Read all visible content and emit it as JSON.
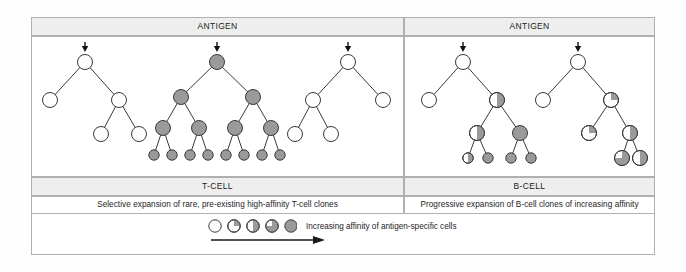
{
  "figure": {
    "panels": [
      {
        "id": "t-cell",
        "antigen_header": "ANTIGEN",
        "cell_type_label": "T-CELL",
        "description": "Selective expansion of rare, pre-existing high-affinity T-cell clones"
      },
      {
        "id": "b-cell",
        "antigen_header": "ANTIGEN",
        "cell_type_label": "B-CELL",
        "description": "Progressive expansion of B-cell clones of increasing affinity"
      }
    ],
    "legend": {
      "label": "Increasing affinity of antigen-specific cells",
      "swatches": [
        {
          "name": "affinity-0",
          "fill": 0
        },
        {
          "name": "affinity-25",
          "fill": 25
        },
        {
          "name": "affinity-50",
          "fill": 50
        },
        {
          "name": "affinity-75",
          "fill": 75
        },
        {
          "name": "affinity-100",
          "fill": 100
        }
      ],
      "arrow_direction": "right"
    },
    "colors": {
      "cell_gray": "#9a9a9a",
      "cell_white": "#ffffff",
      "stroke": "#3a3a3a",
      "band_gray": "#eeeeee",
      "frame": "#b0b0b0"
    },
    "trees": [
      {
        "name": "t-cell-clone-1",
        "antigen_arrow_x": 85,
        "nodes": [
          {
            "id": "t1n0",
            "x": 85,
            "y": 62,
            "fill": 0
          },
          {
            "id": "t1n1",
            "x": 50,
            "y": 100,
            "fill": 0
          },
          {
            "id": "t1n2",
            "x": 119,
            "y": 100,
            "fill": 0
          },
          {
            "id": "t1n3",
            "x": 101,
            "y": 134,
            "fill": 0
          },
          {
            "id": "t1n4",
            "x": 139,
            "y": 134,
            "fill": 0
          }
        ],
        "edges": [
          [
            "t1n0",
            "t1n1"
          ],
          [
            "t1n0",
            "t1n2"
          ],
          [
            "t1n2",
            "t1n3"
          ],
          [
            "t1n2",
            "t1n4"
          ]
        ]
      },
      {
        "name": "t-cell-clone-2",
        "antigen_arrow_x": 217,
        "nodes": [
          {
            "id": "t2n0",
            "x": 217,
            "y": 62,
            "fill": 100
          },
          {
            "id": "t2n1",
            "x": 181,
            "y": 97,
            "fill": 100
          },
          {
            "id": "t2n2",
            "x": 253,
            "y": 97,
            "fill": 100
          },
          {
            "id": "t2n3",
            "x": 163,
            "y": 128,
            "fill": 100
          },
          {
            "id": "t2n4",
            "x": 199,
            "y": 128,
            "fill": 100
          },
          {
            "id": "t2n5",
            "x": 235,
            "y": 128,
            "fill": 100
          },
          {
            "id": "t2n6",
            "x": 271,
            "y": 128,
            "fill": 100
          },
          {
            "id": "t2n7",
            "x": 154,
            "y": 155,
            "fill": 100
          },
          {
            "id": "t2n8",
            "x": 172,
            "y": 155,
            "fill": 100
          },
          {
            "id": "t2n9",
            "x": 190,
            "y": 155,
            "fill": 100
          },
          {
            "id": "t2n10",
            "x": 208,
            "y": 155,
            "fill": 100
          },
          {
            "id": "t2n11",
            "x": 226,
            "y": 155,
            "fill": 100
          },
          {
            "id": "t2n12",
            "x": 244,
            "y": 155,
            "fill": 100
          },
          {
            "id": "t2n13",
            "x": 262,
            "y": 155,
            "fill": 100
          },
          {
            "id": "t2n14",
            "x": 280,
            "y": 155,
            "fill": 100
          }
        ],
        "edges": [
          [
            "t2n0",
            "t2n1"
          ],
          [
            "t2n0",
            "t2n2"
          ],
          [
            "t2n1",
            "t2n3"
          ],
          [
            "t2n1",
            "t2n4"
          ],
          [
            "t2n2",
            "t2n5"
          ],
          [
            "t2n2",
            "t2n6"
          ],
          [
            "t2n3",
            "t2n7"
          ],
          [
            "t2n3",
            "t2n8"
          ],
          [
            "t2n4",
            "t2n9"
          ],
          [
            "t2n4",
            "t2n10"
          ],
          [
            "t2n5",
            "t2n11"
          ],
          [
            "t2n5",
            "t2n12"
          ],
          [
            "t2n6",
            "t2n13"
          ],
          [
            "t2n6",
            "t2n14"
          ]
        ]
      },
      {
        "name": "t-cell-clone-3",
        "antigen_arrow_x": 348,
        "nodes": [
          {
            "id": "t3n0",
            "x": 348,
            "y": 62,
            "fill": 0
          },
          {
            "id": "t3n1",
            "x": 313,
            "y": 100,
            "fill": 0
          },
          {
            "id": "t3n2",
            "x": 383,
            "y": 100,
            "fill": 0
          },
          {
            "id": "t3n3",
            "x": 295,
            "y": 134,
            "fill": 0
          },
          {
            "id": "t3n4",
            "x": 331,
            "y": 134,
            "fill": 0
          }
        ],
        "edges": [
          [
            "t3n0",
            "t3n1"
          ],
          [
            "t3n0",
            "t3n2"
          ],
          [
            "t3n1",
            "t3n3"
          ],
          [
            "t3n1",
            "t3n4"
          ]
        ]
      },
      {
        "name": "b-cell-clone-1",
        "antigen_arrow_x": 463,
        "nodes": [
          {
            "id": "b1n0",
            "x": 463,
            "y": 62,
            "fill": 0
          },
          {
            "id": "b1n1",
            "x": 429,
            "y": 100,
            "fill": 0
          },
          {
            "id": "b1n2",
            "x": 497,
            "y": 100,
            "fill": 50
          },
          {
            "id": "b1n3",
            "x": 477,
            "y": 133,
            "fill": 50
          },
          {
            "id": "b1n4",
            "x": 520,
            "y": 133,
            "fill": 100
          },
          {
            "id": "b1n5",
            "x": 468,
            "y": 158,
            "fill": 50
          },
          {
            "id": "b1n6",
            "x": 488,
            "y": 158,
            "fill": 100
          },
          {
            "id": "b1n7",
            "x": 511,
            "y": 158,
            "fill": 100
          },
          {
            "id": "b1n8",
            "x": 531,
            "y": 158,
            "fill": 100
          }
        ],
        "edges": [
          [
            "b1n0",
            "b1n1"
          ],
          [
            "b1n0",
            "b1n2"
          ],
          [
            "b1n2",
            "b1n3"
          ],
          [
            "b1n2",
            "b1n4"
          ],
          [
            "b1n3",
            "b1n5"
          ],
          [
            "b1n3",
            "b1n6"
          ],
          [
            "b1n4",
            "b1n7"
          ],
          [
            "b1n4",
            "b1n8"
          ]
        ]
      },
      {
        "name": "b-cell-clone-2",
        "antigen_arrow_x": 578,
        "nodes": [
          {
            "id": "b2n0",
            "x": 578,
            "y": 62,
            "fill": 0
          },
          {
            "id": "b2n1",
            "x": 543,
            "y": 100,
            "fill": 0
          },
          {
            "id": "b2n2",
            "x": 611,
            "y": 100,
            "fill": 25
          },
          {
            "id": "b2n3",
            "x": 589,
            "y": 133,
            "fill": 25
          },
          {
            "id": "b2n4",
            "x": 630,
            "y": 133,
            "fill": 50
          },
          {
            "id": "b2n5",
            "x": 622,
            "y": 158,
            "fill": 75
          },
          {
            "id": "b2n6",
            "x": 640,
            "y": 158,
            "fill": 50
          }
        ],
        "edges": [
          [
            "b2n0",
            "b2n1"
          ],
          [
            "b2n0",
            "b2n2"
          ],
          [
            "b2n2",
            "b2n3"
          ],
          [
            "b2n2",
            "b2n4"
          ],
          [
            "b2n4",
            "b2n5"
          ],
          [
            "b2n4",
            "b2n6"
          ]
        ]
      }
    ]
  }
}
